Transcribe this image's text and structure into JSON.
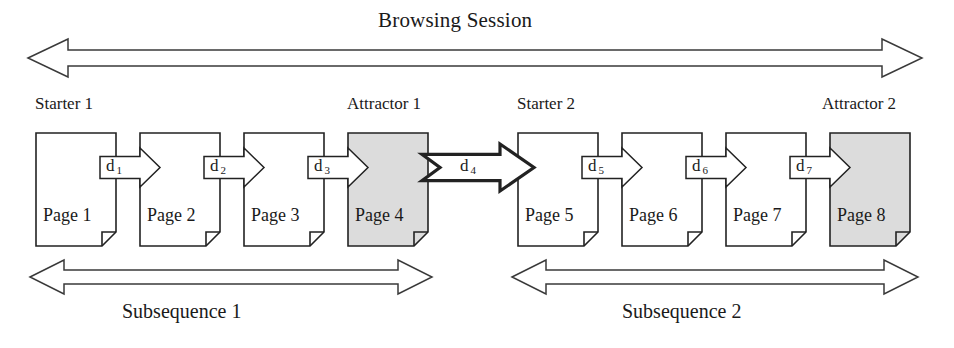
{
  "diagram": {
    "title": "Browsing Session",
    "session_arrow": {
      "name": "browsing-session-arrow",
      "direction": "double"
    },
    "role_labels": [
      {
        "id": "starter-1",
        "text": "Starter 1",
        "x": 35,
        "y": 94
      },
      {
        "id": "attractor-1",
        "text": "Attractor 1",
        "x": 347,
        "y": 94
      },
      {
        "id": "starter-2",
        "text": "Starter 2",
        "x": 517,
        "y": 94
      },
      {
        "id": "attractor-2",
        "text": "Attractor 2",
        "x": 822,
        "y": 94
      }
    ],
    "pages": [
      {
        "id": "page-1",
        "label": "Page 1",
        "x": 36,
        "y": 133,
        "w": 80,
        "h": 113,
        "shaded": false
      },
      {
        "id": "page-2",
        "label": "Page 2",
        "x": 140,
        "y": 133,
        "w": 80,
        "h": 113,
        "shaded": false
      },
      {
        "id": "page-3",
        "label": "Page 3",
        "x": 244,
        "y": 133,
        "w": 80,
        "h": 113,
        "shaded": false
      },
      {
        "id": "page-4",
        "label": "Page 4",
        "x": 348,
        "y": 133,
        "w": 80,
        "h": 113,
        "shaded": true
      },
      {
        "id": "page-5",
        "label": "Page 5",
        "x": 518,
        "y": 133,
        "w": 80,
        "h": 113,
        "shaded": false
      },
      {
        "id": "page-6",
        "label": "Page 6",
        "x": 622,
        "y": 133,
        "w": 80,
        "h": 113,
        "shaded": false
      },
      {
        "id": "page-7",
        "label": "Page 7",
        "x": 726,
        "y": 133,
        "w": 80,
        "h": 113,
        "shaded": false
      },
      {
        "id": "page-8",
        "label": "Page 8",
        "x": 830,
        "y": 133,
        "w": 80,
        "h": 113,
        "shaded": true
      }
    ],
    "transitions": [
      {
        "id": "d-1",
        "letter": "d",
        "subscript": "1",
        "x": 100,
        "y": 148,
        "w": 60,
        "h": 39,
        "bold": false,
        "notched": false
      },
      {
        "id": "d-2",
        "letter": "d",
        "subscript": "2",
        "x": 204,
        "y": 148,
        "w": 60,
        "h": 39,
        "bold": false,
        "notched": false
      },
      {
        "id": "d-3",
        "letter": "d",
        "subscript": "3",
        "x": 308,
        "y": 148,
        "w": 60,
        "h": 39,
        "bold": false,
        "notched": false
      },
      {
        "id": "d-4",
        "letter": "d",
        "subscript": "4",
        "x": 422,
        "y": 144,
        "w": 112,
        "h": 47,
        "bold": true,
        "notched": true
      },
      {
        "id": "d-5",
        "letter": "d",
        "subscript": "5",
        "x": 582,
        "y": 148,
        "w": 60,
        "h": 39,
        "bold": false,
        "notched": false
      },
      {
        "id": "d-6",
        "letter": "d",
        "subscript": "6",
        "x": 686,
        "y": 148,
        "w": 60,
        "h": 39,
        "bold": false,
        "notched": false
      },
      {
        "id": "d-7",
        "letter": "d",
        "subscript": "7",
        "x": 790,
        "y": 148,
        "w": 60,
        "h": 39,
        "bold": false,
        "notched": false
      }
    ],
    "subsequences": [
      {
        "id": "subsequence-1",
        "label": "Subsequence 1",
        "arrow_x1": 30,
        "arrow_x2": 432,
        "label_x": 122,
        "label_y": 300
      },
      {
        "id": "subsequence-2",
        "label": "Subsequence 2",
        "arrow_x1": 512,
        "arrow_x2": 918,
        "label_x": 622,
        "label_y": 300
      }
    ],
    "colors": {
      "stroke": "#222222",
      "shaded_fill": "#dcdcdc",
      "page_fill": "#ffffff",
      "background": "#ffffff"
    }
  }
}
